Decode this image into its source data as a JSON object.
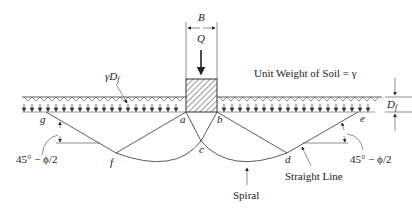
{
  "diagram": {
    "type": "bearing-capacity-failure-surface",
    "labels": {
      "width": "B",
      "load": "Q",
      "surcharge": "γD",
      "surcharge_sub": "f",
      "unit_weight": "Unit Weight of Soil = γ",
      "depth": "D",
      "depth_sub": "f",
      "angle_left": "45° − ϕ/2",
      "angle_right": "45° − ϕ/2",
      "straight_line": "Straight Line",
      "spiral": "Spiral"
    },
    "points": {
      "a": "a",
      "b": "b",
      "c": "c",
      "d": "d",
      "e": "e",
      "f": "f",
      "g": "g"
    },
    "colors": {
      "line": "#333333",
      "text": "#222222",
      "background": "#ffffff"
    }
  }
}
